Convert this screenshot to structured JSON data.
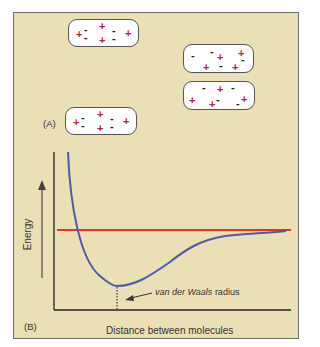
{
  "panel": {
    "background": "#ebdfb5",
    "border": "#6f6f6f"
  },
  "panel_a": {
    "label": "(A)",
    "molecules": [
      {
        "id": "mol-top-left",
        "charges": [
          "+",
          "-",
          "+",
          "-",
          "-",
          "+",
          "-",
          "+"
        ]
      },
      {
        "id": "mol-bottom-left",
        "charges": [
          "+",
          "-",
          "+",
          "-",
          "-",
          "+",
          "-",
          "+"
        ]
      },
      {
        "id": "mol-right-upper",
        "charges": [
          "-",
          "-",
          "+",
          "+",
          "-",
          "+",
          "-",
          "+"
        ]
      },
      {
        "id": "mol-right-lower",
        "charges": [
          "-",
          "+",
          "-",
          "+",
          "+",
          "-",
          "-",
          "+"
        ]
      }
    ],
    "plus_color": "#a8274b",
    "minus_color": "#222222"
  },
  "panel_b": {
    "label": "(B)",
    "y_axis_label": "Energy",
    "x_axis_label": "Distance between molecules",
    "annotation_italic": "van der Waals",
    "annotation_rest": " radius",
    "curve_color": "#4a5ba8",
    "reference_line_color": "#e0352a"
  }
}
